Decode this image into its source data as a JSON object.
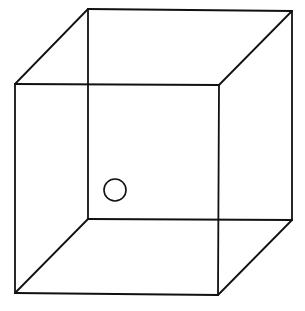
{
  "diagram": {
    "title": "",
    "type": "necker-cube",
    "line_color": "#111111",
    "background": "#ffffff",
    "vertices": {
      "front_top_left": [
        15,
        84
      ],
      "front_top_right": [
        219,
        85
      ],
      "front_bottom_left": [
        15,
        293
      ],
      "front_bottom_right": [
        218,
        295
      ],
      "back_top_left": [
        88,
        9
      ],
      "back_top_right": [
        292,
        11
      ],
      "back_bottom_left": [
        88,
        219
      ],
      "back_bottom_right": [
        292,
        220
      ]
    },
    "edges": [
      [
        "front_top_left",
        "front_top_right"
      ],
      [
        "front_top_right",
        "front_bottom_right"
      ],
      [
        "front_bottom_right",
        "front_bottom_left"
      ],
      [
        "front_bottom_left",
        "front_top_left"
      ],
      [
        "back_top_left",
        "back_top_right"
      ],
      [
        "back_top_right",
        "back_bottom_right"
      ],
      [
        "back_bottom_right",
        "back_bottom_left"
      ],
      [
        "back_bottom_left",
        "back_top_left"
      ],
      [
        "front_top_left",
        "back_top_left"
      ],
      [
        "front_top_right",
        "back_top_right"
      ],
      [
        "front_bottom_left",
        "back_bottom_left"
      ],
      [
        "front_bottom_right",
        "back_bottom_right"
      ]
    ],
    "marker": {
      "shape": "circle",
      "center": [
        115,
        190
      ],
      "radius": 11
    }
  }
}
